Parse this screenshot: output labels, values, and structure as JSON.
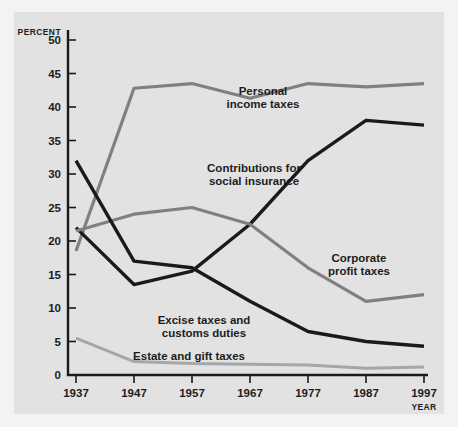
{
  "chart_data": {
    "type": "line",
    "title": "",
    "xlabel": "YEAR",
    "ylabel": "PERCENT",
    "x": [
      1937,
      1947,
      1957,
      1967,
      1977,
      1987,
      1997
    ],
    "categories": [
      "1937",
      "1947",
      "1957",
      "1967",
      "1977",
      "1987",
      "1997"
    ],
    "xlim": [
      1937,
      1997
    ],
    "ylim": [
      0,
      50
    ],
    "yticks": [
      0,
      5,
      10,
      15,
      20,
      25,
      30,
      35,
      40,
      45,
      50
    ],
    "ytick_labels": [
      "0",
      "5",
      "10",
      "15",
      "20",
      "25",
      "30",
      "35",
      "40",
      "45",
      "50"
    ],
    "grid": false,
    "legend_position": "inline-annotations",
    "series": [
      {
        "name": "Personal income taxes",
        "color": "#808080",
        "values": [
          18.5,
          42.8,
          43.5,
          41.3,
          43.5,
          43.0,
          43.5
        ]
      },
      {
        "name": "Contributions for social insurance",
        "color": "#1a1a1a",
        "values": [
          22.0,
          13.5,
          15.5,
          22.5,
          32.0,
          38.0,
          37.3
        ]
      },
      {
        "name": "Corporate profit taxes",
        "color": "#808080",
        "values": [
          21.5,
          24.0,
          25.0,
          22.5,
          16.0,
          11.0,
          12.0
        ]
      },
      {
        "name": "Excise taxes and customs duties",
        "color": "#1a1a1a",
        "values": [
          32.0,
          17.0,
          16.0,
          11.0,
          6.5,
          5.0,
          4.3
        ]
      },
      {
        "name": "Estate and gift taxes",
        "color": "#a6a6a6",
        "values": [
          5.5,
          2.0,
          1.7,
          1.6,
          1.5,
          1.0,
          1.2
        ]
      }
    ],
    "annotations": [
      {
        "id": "personal-income-taxes-label",
        "line1": "Personal",
        "line2": "income taxes"
      },
      {
        "id": "contributions-social-insurance-label",
        "line1": "Contributions for",
        "line2": "social insurance"
      },
      {
        "id": "corporate-profit-taxes-label",
        "line1": "Corporate",
        "line2": "profit taxes"
      },
      {
        "id": "excise-customs-label",
        "line1": "Excise taxes and",
        "line2": "customs duties"
      },
      {
        "id": "estate-gift-label",
        "line1": "Estate and gift taxes",
        "line2": ""
      }
    ]
  },
  "colors": {
    "background": "#f3f3f3",
    "plot_background": "#e2e2e2",
    "axis": "#1a1a1a",
    "gray_series": "#808080",
    "black_series": "#1a1a1a",
    "light_gray_series": "#a6a6a6"
  }
}
